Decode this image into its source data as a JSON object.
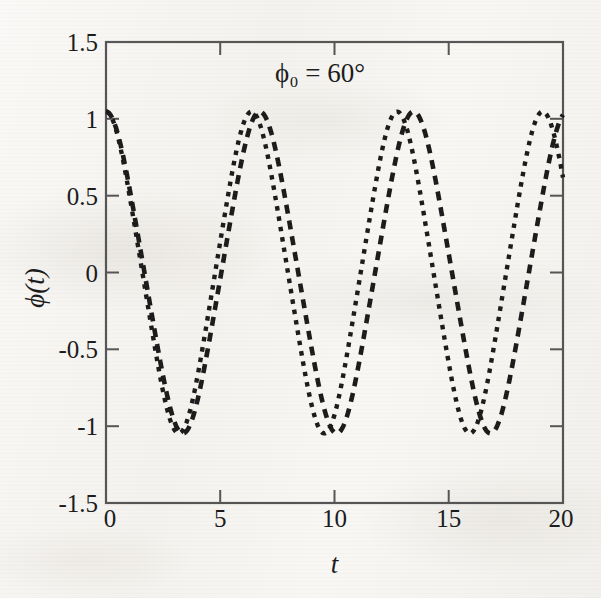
{
  "figure": {
    "annotation": "ϕ₀ = 60°",
    "xlabel": "t",
    "ylabel": "ϕ(t)"
  },
  "axes": {
    "x_ticks": [
      "0",
      "5",
      "10",
      "15",
      "20"
    ],
    "y_ticks": [
      "1.5",
      "1",
      "0.5",
      "0",
      "-0.5",
      "-1",
      "-1.5"
    ]
  },
  "colors": {
    "curve": "#1b1b1b",
    "frame": "#555555",
    "paper": "#f7f6f3"
  },
  "chart_data": {
    "type": "line",
    "title": "ϕ₀ = 60°",
    "xlabel": "t",
    "ylabel": "ϕ(t)",
    "xlim": [
      0,
      20
    ],
    "ylim": [
      -1.5,
      1.5
    ],
    "xticks": [
      0,
      5,
      10,
      15,
      20
    ],
    "yticks": [
      1.5,
      1,
      0.5,
      0,
      -0.5,
      -1,
      -1.5
    ],
    "grid": false,
    "legend": "none",
    "amplitude_rad": 1.047,
    "series": [
      {
        "name": "curve-dashed-long",
        "style": "dashed",
        "period": 6.73,
        "phase": 0.0,
        "x": [
          0,
          0.5,
          1,
          1.5,
          2,
          2.5,
          3,
          3.5,
          4,
          4.5,
          5,
          5.5,
          6,
          6.5,
          7,
          7.5,
          8,
          8.5,
          9,
          9.5,
          10,
          10.5,
          11,
          11.5,
          12,
          12.5,
          13,
          13.5,
          14,
          14.5,
          15,
          15.5,
          16,
          16.5,
          17,
          17.5,
          18,
          18.5,
          19,
          19.5,
          20
        ],
        "y": [
          1.047,
          0.994,
          0.842,
          0.604,
          0.306,
          -0.019,
          -0.337,
          -0.616,
          -0.834,
          -0.977,
          -1.041,
          -1.024,
          -0.928,
          -0.759,
          -0.528,
          -0.249,
          0.055,
          0.358,
          0.632,
          0.853,
          1.0,
          1.047,
          1.006,
          0.872,
          0.654,
          0.371,
          0.051,
          -0.275,
          -0.569,
          -0.806,
          -0.966,
          -1.043,
          -1.035,
          -0.948,
          -0.787,
          -0.565,
          -0.295,
          0.004,
          0.309,
          0.592,
          0.823
        ]
      },
      {
        "name": "curve-dotted-short",
        "style": "dotted",
        "period": 6.37,
        "phase": 0.0,
        "x": [
          0,
          0.5,
          1,
          1.5,
          2,
          2.5,
          3,
          3.5,
          4,
          4.5,
          5,
          5.5,
          6,
          6.5,
          7,
          7.5,
          8,
          8.5,
          9,
          9.5,
          10,
          10.5,
          11,
          11.5,
          12,
          12.5,
          13,
          13.5,
          14,
          14.5,
          15,
          15.5,
          16,
          16.5,
          17,
          17.5,
          18,
          18.5,
          19,
          19.5,
          20
        ],
        "y": [
          1.047,
          0.986,
          0.81,
          0.54,
          0.208,
          -0.143,
          -0.47,
          -0.74,
          -0.93,
          -1.027,
          -1.03,
          -0.941,
          -0.77,
          -0.535,
          -0.252,
          0.058,
          0.364,
          0.643,
          0.87,
          1.009,
          1.047,
          0.976,
          0.791,
          0.514,
          0.178,
          -0.173,
          -0.498,
          -0.762,
          -0.941,
          -1.029,
          -1.022,
          -0.924,
          -0.745,
          -0.506,
          -0.219,
          0.091,
          0.394,
          0.668,
          0.886,
          1.016,
          1.046
        ]
      }
    ]
  }
}
